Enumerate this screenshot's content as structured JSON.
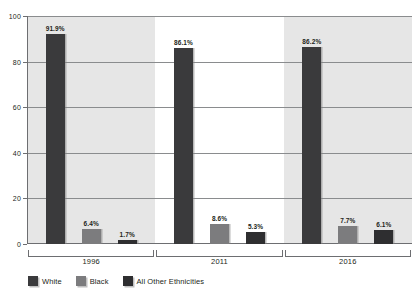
{
  "chart_data": {
    "type": "bar",
    "title": "",
    "subtitle": "",
    "xlabel": "",
    "ylabel": "",
    "categories": [
      "1996",
      "2011",
      "2016"
    ],
    "series": [
      {
        "name": "White",
        "color": "#3a3a3c",
        "values": [
          91.9,
          86.1,
          86.2
        ],
        "labels": [
          "91.9%",
          "86.1%",
          "86.2%"
        ]
      },
      {
        "name": "Black",
        "color": "#7c7c7e",
        "values": [
          6.4,
          8.6,
          7.7
        ],
        "labels": [
          "6.4%",
          "8.6%",
          "7.7%"
        ]
      },
      {
        "name": "All Other Ethnicities",
        "color": "#2e2e30",
        "values": [
          1.7,
          5.3,
          6.1
        ],
        "labels": [
          "1.7%",
          "5.3%",
          "6.1%"
        ]
      }
    ],
    "ylim": [
      0,
      100
    ],
    "yticks": [
      0,
      20,
      40,
      60,
      80,
      100
    ],
    "ytick_labels": [
      "0",
      "20",
      "40",
      "60",
      "80",
      "100"
    ],
    "grid": true,
    "grid_axis": "y",
    "legend_position": "bottom-left",
    "band_shading": [
      "shade",
      "plain",
      "shade"
    ]
  },
  "axis": {
    "y_labels": [
      "100",
      "80",
      "60",
      "40",
      "20",
      "0"
    ]
  },
  "groups": [
    {
      "label": "1996"
    },
    {
      "label": "2011"
    },
    {
      "label": "2016"
    }
  ],
  "legend": {
    "items": [
      {
        "label": "White"
      },
      {
        "label": "Black"
      },
      {
        "label": "All Other Ethnicities"
      }
    ]
  }
}
